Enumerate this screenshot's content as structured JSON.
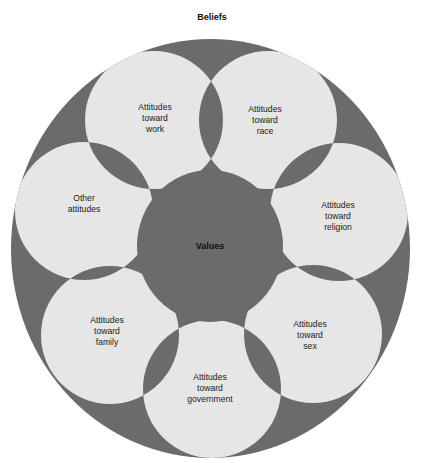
{
  "title": "Beliefs",
  "center": {
    "label": "Values",
    "cx": 210,
    "cy": 246,
    "rx": 73,
    "ry": 76
  },
  "outer": {
    "cx": 210.5,
    "cy": 248.5,
    "rx": 199.5,
    "ry": 209.5
  },
  "colors": {
    "dark": "#6b6b6b",
    "light": "#e6e6e6",
    "background": "#ffffff",
    "text": "#1a1a1a"
  },
  "petal_radius": 69,
  "petals": [
    {
      "id": "work",
      "cx": 154,
      "cy": 120,
      "lines": [
        "Attitudes",
        "toward",
        "work"
      ],
      "tx": 155,
      "ty": 110
    },
    {
      "id": "race",
      "cx": 268,
      "cy": 120,
      "lines": [
        "Attitudes",
        "toward",
        "race"
      ],
      "tx": 265,
      "ty": 112
    },
    {
      "id": "religion",
      "cx": 339,
      "cy": 212,
      "lines": [
        "Attitudes",
        "toward",
        "religion"
      ],
      "tx": 338,
      "ty": 208
    },
    {
      "id": "sex",
      "cx": 313,
      "cy": 334,
      "lines": [
        "Attitudes",
        "toward",
        "sex"
      ],
      "tx": 310,
      "ty": 327
    },
    {
      "id": "government",
      "cx": 212,
      "cy": 389,
      "lines": [
        "Attitudes",
        "toward",
        "government"
      ],
      "tx": 210,
      "ty": 380
    },
    {
      "id": "family",
      "cx": 110,
      "cy": 335,
      "lines": [
        "Attitudes",
        "toward",
        "family"
      ],
      "tx": 107,
      "ty": 323
    },
    {
      "id": "other",
      "cx": 84,
      "cy": 211,
      "lines": [
        "Other",
        "attitudes"
      ],
      "tx": 84,
      "ty": 201
    }
  ]
}
